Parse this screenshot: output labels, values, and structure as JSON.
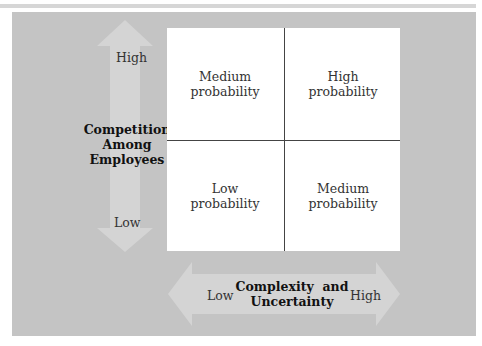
{
  "diagram": {
    "type": "2x2 matrix",
    "y_axis": {
      "title": "Competition Among Employees",
      "title_lines": [
        "Competition",
        "Among",
        "Employees"
      ],
      "high": "High",
      "low": "Low"
    },
    "x_axis": {
      "title": "Complexity and Uncertainty",
      "title_lines": [
        "Complexity  and",
        "Uncertainty"
      ],
      "low": "Low",
      "high": "High"
    },
    "cells": [
      {
        "position": "top-left",
        "lines": [
          "Medium",
          "probability"
        ]
      },
      {
        "position": "top-right",
        "lines": [
          "High",
          "probability"
        ]
      },
      {
        "position": "bottom-left",
        "lines": [
          "Low",
          "probability"
        ]
      },
      {
        "position": "bottom-right",
        "lines": [
          "Medium",
          "probability"
        ]
      }
    ]
  },
  "colors": {
    "panel": "#c4c4c4",
    "arrow": "#d6d6d6",
    "grid": "#ffffff",
    "divider": "#444444"
  }
}
